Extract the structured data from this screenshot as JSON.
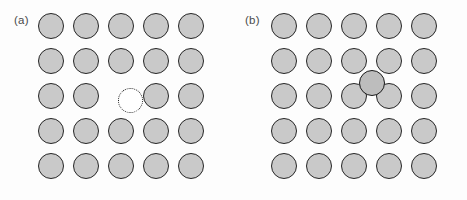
{
  "figure": {
    "width": 467,
    "height": 200,
    "background_color": "#fdfdfd"
  },
  "style": {
    "atom_fill": "#c9c9c9",
    "atom_stroke": "#262626",
    "vacancy_fill": "#ffffff",
    "vacancy_stroke": "#1c1c1c",
    "interstitial_fill": "#bdbdbd",
    "interstitial_stroke": "#1a1a1a",
    "label_color": "#4a4a4a",
    "atom_diameter": 26,
    "lattice_spacing": 35
  },
  "panels": [
    {
      "id": "a",
      "label": "(a)",
      "label_x": 14,
      "label_y": 14,
      "defect_type": "vacancy",
      "origin_x": 51,
      "origin_y": 26,
      "rows": 5,
      "cols": 5,
      "spacing": 35,
      "vacancy": {
        "row": 2,
        "col": 2,
        "cx": 130.5,
        "cy": 100.5
      }
    },
    {
      "id": "b",
      "label": "(b)",
      "label_x": 12,
      "label_y": 14,
      "defect_type": "interstitial",
      "origin_x": 51,
      "origin_y": 26,
      "rows": 5,
      "cols": 5,
      "spacing": 35,
      "interstitial": {
        "cx": 139,
        "cy": 83
      }
    }
  ]
}
